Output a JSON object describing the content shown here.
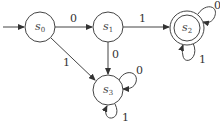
{
  "diagram": {
    "type": "finite-automaton",
    "start_state": "s0",
    "accepting_states": [
      "s2"
    ],
    "states": [
      {
        "id": "s0",
        "label": "s",
        "sub": "0"
      },
      {
        "id": "s1",
        "label": "s",
        "sub": "1"
      },
      {
        "id": "s2",
        "label": "s",
        "sub": "2"
      },
      {
        "id": "s3",
        "label": "s",
        "sub": "3"
      }
    ],
    "transitions": [
      {
        "from": "s0",
        "to": "s1",
        "label": "0"
      },
      {
        "from": "s0",
        "to": "s3",
        "label": "1"
      },
      {
        "from": "s1",
        "to": "s2",
        "label": "1"
      },
      {
        "from": "s1",
        "to": "s3",
        "label": "0"
      },
      {
        "from": "s2",
        "to": "s2",
        "label": "0"
      },
      {
        "from": "s2",
        "to": "s2",
        "label": "1"
      },
      {
        "from": "s3",
        "to": "s3",
        "label": "0"
      },
      {
        "from": "s3",
        "to": "s3",
        "label": "1"
      }
    ]
  }
}
